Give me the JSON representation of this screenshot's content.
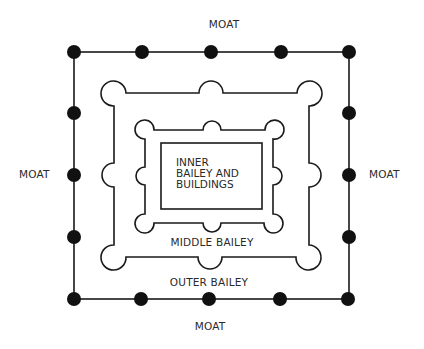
{
  "diagram": {
    "labels": {
      "moat_top": "MOAT",
      "moat_left": "MOAT",
      "moat_right": "MOAT",
      "moat_bottom": "MOAT",
      "inner_bailey": [
        "INNER",
        "BAILEY AND",
        "BUILDINGS"
      ],
      "middle_bailey": "MIDDLE BAILEY",
      "outer_bailey": "OUTER BAILEY"
    },
    "colors": {
      "line": "#1a1a1a",
      "text": "#2a2a2a",
      "background": "#ffffff"
    },
    "outer_wall": {
      "shape": "square with round towers (filled dots)",
      "tower_count": 16
    },
    "middle_wall": {
      "shape": "rectangle with semicircular bastions at corners and mid-sides",
      "tower_count": 8
    },
    "inner_wall": {
      "shape": "rectangle with semicircular bastions at corners and mid-sides",
      "tower_count": 8
    },
    "keep": {
      "shape": "rectangle"
    }
  }
}
